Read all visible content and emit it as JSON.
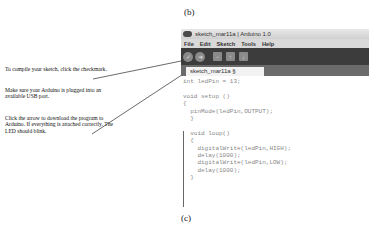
{
  "labels": {
    "top": "(b)",
    "bottom": "(c)"
  },
  "notes": [
    "To compile your sketch, click the checkmark.",
    "Make sure your Arduino is plugged into an available USB port.",
    "Click the arrow to download the program to Arduino. If everything is attached correctly. The LED should blink."
  ],
  "window": {
    "title": "sketch_mar11a | Arduino 1.0",
    "menu": [
      "File",
      "Edit",
      "Sketch",
      "Tools",
      "Help"
    ],
    "toolbar": [
      {
        "name": "verify",
        "glyph": "✓"
      },
      {
        "name": "upload",
        "glyph": "➜"
      },
      {
        "name": "new",
        "glyph": "▫"
      },
      {
        "name": "open",
        "glyph": "↑"
      },
      {
        "name": "save",
        "glyph": "↓"
      }
    ],
    "tab": "sketch_mar11a §",
    "code": [
      "int ledPin = 13;",
      "",
      "void setup ()",
      "{",
      "  pinMode(ledPin,OUTPUT);",
      "  }",
      "",
      "  void loop()",
      "  {",
      "    digitalWrite(ledPin,HIGH);",
      "    delay(1000);",
      "    digitalWrite(ledPin,LOW);",
      "    delay(1000);",
      "  }"
    ]
  }
}
